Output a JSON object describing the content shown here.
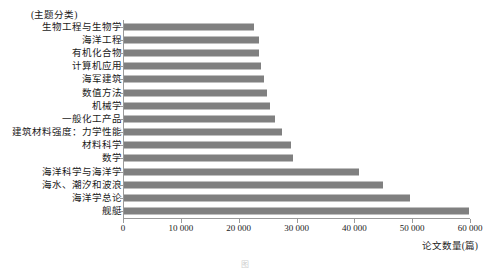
{
  "chart_data": {
    "type": "bar",
    "orientation": "horizontal",
    "title": "",
    "category_axis_title": "(主题分类)",
    "value_axis_title": "论文数量(篇)",
    "xlabel": "论文数量(篇)",
    "ylabel": "(主题分类)",
    "xlim": [
      0,
      60000
    ],
    "xticks": [
      0,
      10000,
      20000,
      30000,
      40000,
      50000,
      60000
    ],
    "xtick_labels": [
      "0",
      "10 000",
      "20 000",
      "30 000",
      "40 000",
      "50 000",
      "60 000"
    ],
    "grid": false,
    "legend": "none",
    "bar_color": "#808080",
    "axis_color": "#9a9a9a",
    "categories": [
      "生物工程与生物学",
      "海洋工程",
      "有机化合物",
      "计算机应用",
      "海军建筑",
      "数值方法",
      "机械学",
      "一般化工产品",
      "建筑材料强度：力学性能",
      "材料科学",
      "数学",
      "海洋科学与海洋学",
      "海水、潮汐和波浪",
      "海洋学总论",
      "舰艇"
    ],
    "values": [
      22500,
      23300,
      23400,
      23700,
      24200,
      24700,
      25200,
      26100,
      27400,
      28900,
      29200,
      40600,
      44800,
      49500,
      59700
    ],
    "bars": [
      {
        "label": "生物工程与生物学",
        "value": 22500
      },
      {
        "label": "海洋工程",
        "value": 23300
      },
      {
        "label": "有机化合物",
        "value": 23400
      },
      {
        "label": "计算机应用",
        "value": 23700
      },
      {
        "label": "海军建筑",
        "value": 24200
      },
      {
        "label": "数值方法",
        "value": 24700
      },
      {
        "label": "机械学",
        "value": 25200
      },
      {
        "label": "一般化工产品",
        "value": 26100
      },
      {
        "label": "建筑材料强度：力学性能",
        "value": 27400
      },
      {
        "label": "材料科学",
        "value": 28900
      },
      {
        "label": "数学",
        "value": 29200
      },
      {
        "label": "海洋科学与海洋学",
        "value": 40600
      },
      {
        "label": "海水、潮汐和波浪",
        "value": 44800
      },
      {
        "label": "海洋学总论",
        "value": 49500
      },
      {
        "label": "舰艇",
        "value": 59700
      }
    ]
  },
  "caption": "图"
}
